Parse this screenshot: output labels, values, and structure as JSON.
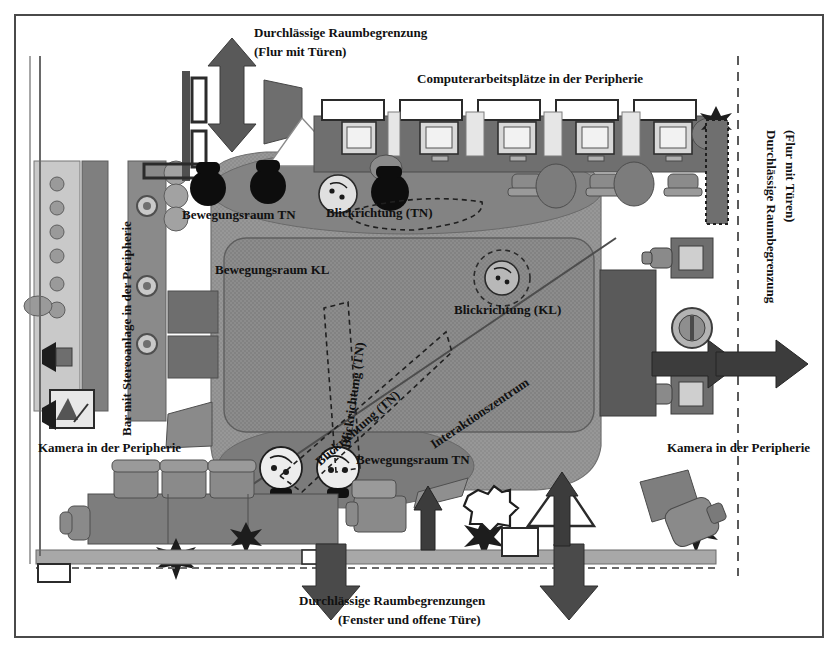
{
  "diagram": {
    "title_language": "de",
    "labels": {
      "top_corridor_line1": "Durchlässige Raumbegrenzung",
      "top_corridor_line2": "(Flur mit Türen)",
      "computer_workstations": "Computerarbeitsplätze in der Peripherie",
      "right_corridor_line1": "Durchlässige Raumbegrenzung",
      "right_corridor_line2": "(Flur mit Türen)",
      "bar_stereo": "Bar mit Stereoanlage in der Peripherie",
      "movement_tn_top": "Bewegungsraum TN",
      "gaze_tn_top": "Blickrichtung (TN)",
      "movement_kl": "Bewegungsraum KL",
      "gaze_tn_vertical": "Blickrichtung (TN)",
      "gaze_tn_diagonal": "Blickrichtung (TN)",
      "gaze_kl": "Blickrichtung (KL)",
      "interaction_center": "Interaktionszentrum",
      "movement_tn_bottom": "Bewegungsraum TN",
      "camera_left": "Kamera in der Peripherie",
      "camera_right": "Kamera in der Peripherie",
      "bottom_boundaries_line1": "Durchlässige Raumbegrenzungen",
      "bottom_boundaries_line2": "(Fenster und offene Türe)"
    },
    "colors": {
      "frame_border": "#4a4a4a",
      "background": "#ffffff",
      "zone_outer": "#8e8e8e",
      "zone_inner": "#7f7f7f",
      "zone_light": "#b9b9b9",
      "furniture_dark": "#6b6b6b",
      "furniture_mid": "#8a8a8a",
      "furniture_light": "#c4c4c4",
      "arrow_fill": "#595959",
      "person_dark": "#0d0d0d",
      "person_light": "#d8d8d8",
      "text": "#111111",
      "dashed_stroke": "#2a2a2a"
    },
    "icons": {
      "arrow_up_down": "double-arrow-vertical",
      "arrow_right": "arrow-right",
      "arrow_left": "arrow-left",
      "arrow_down": "arrow-down",
      "plant": "plant-icon",
      "monitor": "monitor-icon",
      "chair": "chair-icon",
      "camera": "camera-icon",
      "person": "person-icon",
      "sofa": "sofa-icon",
      "speaker": "speaker-icon",
      "star": "star-shape"
    }
  }
}
